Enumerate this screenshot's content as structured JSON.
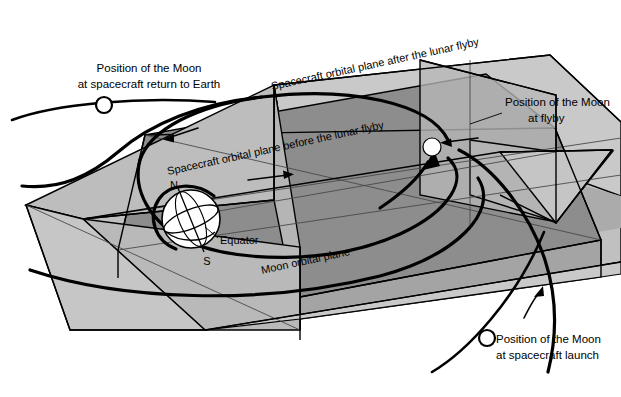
{
  "figure": {
    "background_color": "#ffffff",
    "width": 621,
    "height": 397
  },
  "palette": {
    "plane_light": "#c9c9c9",
    "plane_mid": "#b0b0b0",
    "plane_dark": "#8f8f8f",
    "plane_darker": "#7d7d7d",
    "outline": "#000000",
    "thin_line": "#4a4a4a",
    "moon_fill": "#ffffff",
    "earth_fill": "#ffffff"
  },
  "labels": {
    "moon_return": {
      "line1": "Position of the Moon",
      "line2": "at spacecraft return to Earth",
      "x": 60,
      "y": 70
    },
    "moon_flyby": {
      "line1": "Position of the Moon",
      "line2": "at flyby",
      "x": 505,
      "y": 103
    },
    "moon_launch": {
      "line1": "Position of the Moon",
      "line2": "at spacecraft launch",
      "x": 494,
      "y": 345
    },
    "plane_after": {
      "text": "Spacecraft orbital plane after the lunar flyby",
      "rotation": -13.5
    },
    "plane_before": {
      "text": "Spacecraft orbital plane before the lunar flyby",
      "rotation": -13.5
    },
    "moon_plane": {
      "text": "Moon orbital plane",
      "rotation": -13.5
    },
    "globe": {
      "north": "N",
      "south": "S",
      "equator": "Equator"
    }
  },
  "markers": {
    "moon_return_dot": {
      "cx": 104,
      "cy": 105,
      "r": 8
    },
    "moon_flyby_dot": {
      "cx": 432,
      "cy": 147,
      "r": 8
    },
    "moon_launch_dot": {
      "cx": 487,
      "cy": 338,
      "r": 8
    },
    "earth": {
      "cx": 191,
      "cy": 219,
      "r": 29
    }
  },
  "annotations": {
    "direction_arrow_return": "arrow pointing left along upper orbit",
    "direction_arrow_outbound": "arrow pointing right along lower orbit",
    "direction_arrow_flyby": "arrow pointing left into flyby moon",
    "direction_arrow_launch": "arrow pointing up-right along launch arc",
    "flyby_capture_arrow": "bold arrow curving up into flyby point"
  }
}
